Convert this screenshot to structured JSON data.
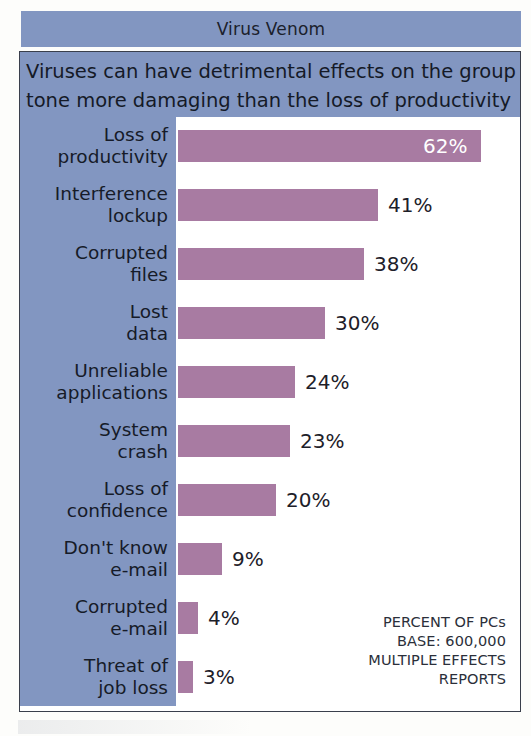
{
  "header": {
    "title": "Virus Venom"
  },
  "subtitle": {
    "line1": "Viruses can have detrimental effects on the group",
    "line2": "tone more damaging than the loss of productivity"
  },
  "footnote": {
    "line1": "PERCENT OF PCs",
    "line2": "BASE: 600,000",
    "line3": "MULTIPLE EFFECTS",
    "line4": "REPORTS"
  },
  "colors": {
    "banner_blue": "#8296c1",
    "bar_mauve": "#a87ba2",
    "frame": "#3a3f4c",
    "text_dark": "#161b28",
    "value_inside": "#ffffff",
    "plot_background": "#ffffff"
  },
  "chart_data": {
    "type": "bar",
    "orientation": "horizontal",
    "title": "Virus Venom",
    "subtitle": "Viruses can have detrimental effects on the group tone more damaging than the loss of productivity",
    "xlabel": "",
    "ylabel": "",
    "xlim": [
      0,
      70
    ],
    "grid": false,
    "legend": null,
    "value_suffix": "%",
    "note": "PERCENT OF PCs / BASE: 600,000 / MULTIPLE EFFECTS / REPORTS",
    "categories": [
      "Loss of productivity",
      "Interference lockup",
      "Corrupted files",
      "Lost data",
      "Unreliable applications",
      "System crash",
      "Loss of confidence",
      "Don't know e-mail",
      "Corrupted e-mail",
      "Threat of job loss"
    ],
    "values": [
      62,
      41,
      38,
      30,
      24,
      23,
      20,
      9,
      4,
      3
    ],
    "value_labels": [
      "62%",
      "41%",
      "38%",
      "30%",
      "24%",
      "23%",
      "20%",
      "9%",
      "4%",
      "3%"
    ],
    "bars": [
      {
        "label_line1": "Loss of",
        "label_line2": "productivity",
        "value": 62,
        "value_label": "62%",
        "label_position": "inside"
      },
      {
        "label_line1": "Interference",
        "label_line2": "lockup",
        "value": 41,
        "value_label": "41%",
        "label_position": "outside"
      },
      {
        "label_line1": "Corrupted",
        "label_line2": "files",
        "value": 38,
        "value_label": "38%",
        "label_position": "outside"
      },
      {
        "label_line1": "Lost",
        "label_line2": "data",
        "value": 30,
        "value_label": "30%",
        "label_position": "outside"
      },
      {
        "label_line1": "Unreliable",
        "label_line2": "applications",
        "value": 24,
        "value_label": "24%",
        "label_position": "outside"
      },
      {
        "label_line1": "System",
        "label_line2": "crash",
        "value": 23,
        "value_label": "23%",
        "label_position": "outside"
      },
      {
        "label_line1": "Loss of",
        "label_line2": "confidence",
        "value": 20,
        "value_label": "20%",
        "label_position": "outside"
      },
      {
        "label_line1": "Don't know",
        "label_line2": "e-mail",
        "value": 9,
        "value_label": "9%",
        "label_position": "outside"
      },
      {
        "label_line1": "Corrupted",
        "label_line2": "e-mail",
        "value": 4,
        "value_label": "4%",
        "label_position": "outside"
      },
      {
        "label_line1": "Threat of",
        "label_line2": "job loss",
        "value": 3,
        "value_label": "3%",
        "label_position": "outside"
      }
    ]
  }
}
